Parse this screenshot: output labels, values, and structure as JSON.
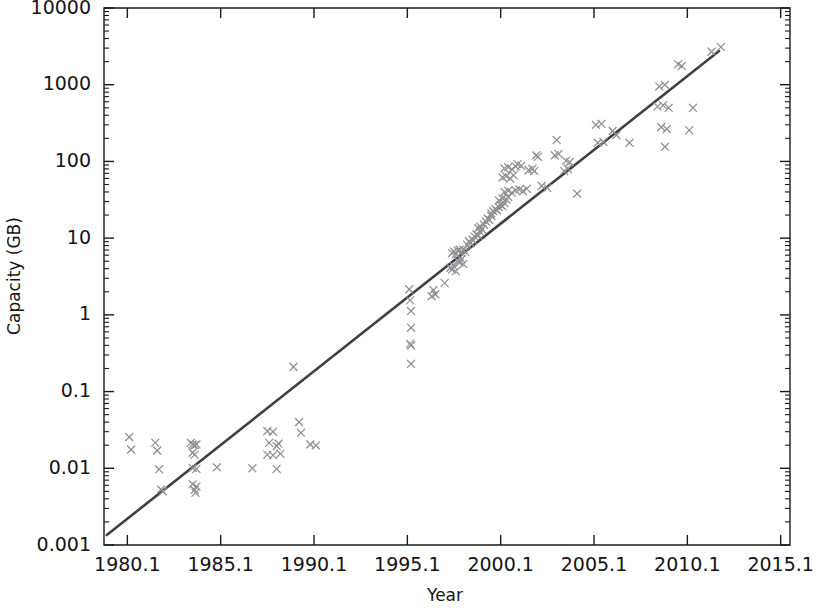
{
  "chart_data": {
    "type": "scatter",
    "title": "",
    "subtitle": "",
    "xlabel": "Year",
    "ylabel": "Capacity (GB)",
    "yscale": "log",
    "xscale": "linear",
    "xlim": [
      1978.85,
      2015.6
    ],
    "ylim": [
      0.001,
      10000
    ],
    "grid": false,
    "legend": null,
    "xticks": [
      "1980.1",
      "1985.1",
      "1990.1",
      "1995.1",
      "2000.1",
      "2005.1",
      "2010.1",
      "2015.1"
    ],
    "xtick_values": [
      1980.1,
      1985.1,
      1990.1,
      1995.1,
      2000.1,
      2005.1,
      2010.1,
      2015.1
    ],
    "yticks": [
      "10000",
      "1000",
      "100",
      "10",
      "1",
      "0.1",
      "0.01",
      "0.001"
    ],
    "ytick_values": [
      10000,
      1000,
      100,
      10,
      1,
      0.1,
      0.01,
      0.001
    ],
    "minor_ticks": "log-decade",
    "marker_style": "x",
    "marker_color": "#8f8f93",
    "line_color": "#3f3f46",
    "frame_color": "#1a1a1a",
    "background": "#ffffff",
    "annotations": [],
    "series": [
      {
        "name": "Hard drive capacity",
        "type": "scatter",
        "marker": "x",
        "points": [
          [
            1980.2,
            0.0255
          ],
          [
            1980.3,
            0.0175
          ],
          [
            1981.6,
            0.0215
          ],
          [
            1981.7,
            0.017
          ],
          [
            1981.8,
            0.0097
          ],
          [
            1981.9,
            0.0053
          ],
          [
            1982.0,
            0.005
          ],
          [
            1983.5,
            0.0215
          ],
          [
            1983.6,
            0.0205
          ],
          [
            1983.7,
            0.02
          ],
          [
            1983.8,
            0.0205
          ],
          [
            1983.6,
            0.016
          ],
          [
            1983.7,
            0.015
          ],
          [
            1983.6,
            0.0101
          ],
          [
            1983.8,
            0.0098
          ],
          [
            1983.6,
            0.0062
          ],
          [
            1983.8,
            0.0058
          ],
          [
            1983.7,
            0.0052
          ],
          [
            1983.75,
            0.0048
          ],
          [
            1984.9,
            0.0103
          ],
          [
            1987.6,
            0.0305
          ],
          [
            1987.9,
            0.03
          ],
          [
            1988.2,
            0.021
          ],
          [
            1987.7,
            0.0215
          ],
          [
            1988.1,
            0.0195
          ],
          [
            1987.6,
            0.015
          ],
          [
            1987.9,
            0.0148
          ],
          [
            1988.3,
            0.0155
          ],
          [
            1988.1,
            0.0098
          ],
          [
            1986.8,
            0.01
          ],
          [
            1989.0,
            0.21
          ],
          [
            1989.3,
            0.04
          ],
          [
            1989.4,
            0.029
          ],
          [
            1989.9,
            0.0205
          ],
          [
            1990.2,
            0.0198
          ],
          [
            1995.2,
            2.15
          ],
          [
            1995.25,
            1.55
          ],
          [
            1995.3,
            1.12
          ],
          [
            1995.3,
            0.68
          ],
          [
            1995.25,
            0.42
          ],
          [
            1995.3,
            0.4
          ],
          [
            1995.3,
            0.23
          ],
          [
            1996.5,
            2.1
          ],
          [
            1996.6,
            1.85
          ],
          [
            1996.4,
            1.75
          ],
          [
            1997.1,
            2.6
          ],
          [
            1997.4,
            4.1
          ],
          [
            1997.5,
            3.9
          ],
          [
            1997.6,
            4.3
          ],
          [
            1997.7,
            3.7
          ],
          [
            1997.5,
            6.4
          ],
          [
            1997.6,
            6.7
          ],
          [
            1997.7,
            6.2
          ],
          [
            1997.8,
            6.9
          ],
          [
            1997.9,
            7.1
          ],
          [
            1998.0,
            6.5
          ],
          [
            1998.1,
            7.0
          ],
          [
            1998.2,
            6.6
          ],
          [
            1997.8,
            5.1
          ],
          [
            1997.9,
            4.8
          ],
          [
            1998.0,
            5.3
          ],
          [
            1998.1,
            4.6
          ],
          [
            1998.3,
            8.2
          ],
          [
            1998.4,
            9.1
          ],
          [
            1998.5,
            8.6
          ],
          [
            1998.6,
            9.5
          ],
          [
            1998.7,
            10.5
          ],
          [
            1998.8,
            11.2
          ],
          [
            1998.9,
            10.8
          ],
          [
            1999.0,
            12.0
          ],
          [
            1998.9,
            13.5
          ],
          [
            1999.0,
            14.2
          ],
          [
            1999.1,
            13.0
          ],
          [
            1999.2,
            15.0
          ],
          [
            1999.3,
            16.5
          ],
          [
            1999.4,
            18.0
          ],
          [
            1999.5,
            17.2
          ],
          [
            1999.6,
            19.5
          ],
          [
            1999.6,
            21.0
          ],
          [
            1999.7,
            22.5
          ],
          [
            1999.8,
            24.0
          ],
          [
            1999.9,
            23.0
          ],
          [
            2000.0,
            25.5
          ],
          [
            2000.1,
            27.0
          ],
          [
            2000.2,
            26.0
          ],
          [
            2000.3,
            28.5
          ],
          [
            2000.0,
            31.0
          ],
          [
            2000.2,
            33.0
          ],
          [
            2000.4,
            32.0
          ],
          [
            2000.5,
            34.5
          ],
          [
            2000.3,
            40.0
          ],
          [
            2000.5,
            41.5
          ],
          [
            2000.7,
            39.0
          ],
          [
            2000.9,
            42.0
          ],
          [
            2001.1,
            43.0
          ],
          [
            2001.3,
            41.0
          ],
          [
            2001.5,
            44.0
          ],
          [
            2000.2,
            62.0
          ],
          [
            2000.4,
            64.0
          ],
          [
            2000.6,
            60.0
          ],
          [
            2000.8,
            66.0
          ],
          [
            2000.3,
            81.0
          ],
          [
            2000.5,
            84.0
          ],
          [
            2000.7,
            79.0
          ],
          [
            2000.9,
            86.0
          ],
          [
            2001.0,
            92.0
          ],
          [
            2001.2,
            88.0
          ],
          [
            2001.6,
            77.0
          ],
          [
            2001.8,
            80.0
          ],
          [
            2001.9,
            75.0
          ],
          [
            2002.0,
            120.0
          ],
          [
            2002.1,
            115.0
          ],
          [
            2002.3,
            48.0
          ],
          [
            2002.6,
            45.0
          ],
          [
            2003.1,
            190.0
          ],
          [
            2003.0,
            120.0
          ],
          [
            2003.2,
            125.0
          ],
          [
            2003.6,
            102.0
          ],
          [
            2003.8,
            98.0
          ],
          [
            2003.5,
            75.0
          ],
          [
            2003.7,
            80.0
          ],
          [
            2004.2,
            38.0
          ],
          [
            2005.2,
            300.0
          ],
          [
            2005.5,
            310.0
          ],
          [
            2005.3,
            175.0
          ],
          [
            2005.6,
            180.0
          ],
          [
            2006.1,
            250.0
          ],
          [
            2006.3,
            220.0
          ],
          [
            2007.0,
            175.0
          ],
          [
            2008.6,
            950.0
          ],
          [
            2008.9,
            1000.0
          ],
          [
            2008.5,
            520.0
          ],
          [
            2008.8,
            540.0
          ],
          [
            2009.1,
            500.0
          ],
          [
            2008.7,
            280.0
          ],
          [
            2009.0,
            265.0
          ],
          [
            2008.9,
            155.0
          ],
          [
            2009.6,
            1850.0
          ],
          [
            2009.8,
            1750.0
          ],
          [
            2010.4,
            500.0
          ],
          [
            2010.2,
            255.0
          ],
          [
            2011.4,
            2700.0
          ],
          [
            2011.9,
            3100.0
          ]
        ]
      },
      {
        "name": "Exponential fit (trend line)",
        "type": "line",
        "endpoints": [
          [
            1979.0,
            0.00135
          ],
          [
            2011.8,
            2750.0
          ]
        ]
      }
    ]
  },
  "axes": {
    "y_title": "Capacity (GB)",
    "x_title": "Year"
  }
}
